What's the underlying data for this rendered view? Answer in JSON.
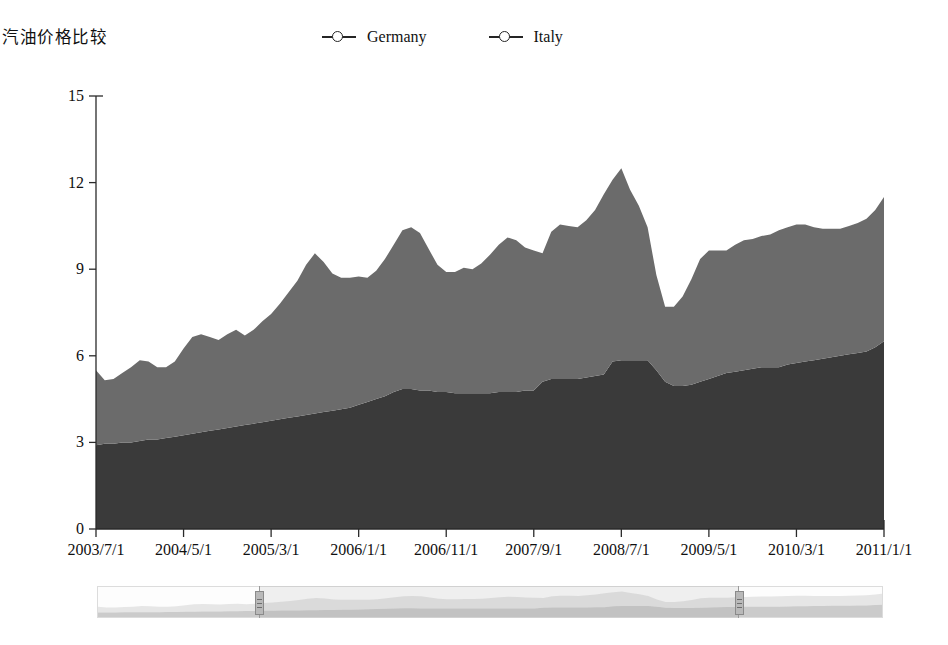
{
  "header": {
    "title": "汽油价格比较"
  },
  "legend": {
    "position": "top-center",
    "items": [
      {
        "label": "Germany",
        "marker": "circle-line-marker-icon",
        "color": "#3a3a3a"
      },
      {
        "label": "Italy",
        "marker": "circle-line-marker-icon",
        "color": "#6b6b6b"
      }
    ]
  },
  "range_selector": {
    "label": "data-zoom-range-selector",
    "start_percent": 20.5,
    "end_percent": 81.5,
    "left_handle": "range-handle-left",
    "right_handle": "range-handle-right"
  },
  "chart_data": {
    "type": "area",
    "stacked": true,
    "title": "汽油价格比较",
    "xlabel": "",
    "ylabel": "",
    "ylim": [
      0,
      15
    ],
    "yticks": [
      0,
      3,
      6,
      9,
      12,
      15
    ],
    "grid": false,
    "legend_position": "top-center",
    "xticks": [
      "2003/7/1",
      "2004/5/1",
      "2005/3/1",
      "2006/1/1",
      "2006/11/1",
      "2007/9/1",
      "2008/7/1",
      "2009/5/1",
      "2010/3/1",
      "2011/1/1"
    ],
    "xtick_interval_months": 10,
    "x": [
      "2003/7/1",
      "2003/8/1",
      "2003/9/1",
      "2003/10/1",
      "2003/11/1",
      "2003/12/1",
      "2004/1/1",
      "2004/2/1",
      "2004/3/1",
      "2004/4/1",
      "2004/5/1",
      "2004/6/1",
      "2004/7/1",
      "2004/8/1",
      "2004/9/1",
      "2004/10/1",
      "2004/11/1",
      "2004/12/1",
      "2005/1/1",
      "2005/2/1",
      "2005/3/1",
      "2005/4/1",
      "2005/5/1",
      "2005/6/1",
      "2005/7/1",
      "2005/8/1",
      "2005/9/1",
      "2005/10/1",
      "2005/11/1",
      "2005/12/1",
      "2006/1/1",
      "2006/2/1",
      "2006/3/1",
      "2006/4/1",
      "2006/5/1",
      "2006/6/1",
      "2006/7/1",
      "2006/8/1",
      "2006/9/1",
      "2006/10/1",
      "2006/11/1",
      "2006/12/1",
      "2007/1/1",
      "2007/2/1",
      "2007/3/1",
      "2007/4/1",
      "2007/5/1",
      "2007/6/1",
      "2007/7/1",
      "2007/8/1",
      "2007/9/1",
      "2007/10/1",
      "2007/11/1",
      "2007/12/1",
      "2008/1/1",
      "2008/2/1",
      "2008/3/1",
      "2008/4/1",
      "2008/5/1",
      "2008/6/1",
      "2008/7/1",
      "2008/8/1",
      "2008/9/1",
      "2008/10/1",
      "2008/11/1",
      "2008/12/1",
      "2009/1/1",
      "2009/2/1",
      "2009/3/1",
      "2009/4/1",
      "2009/5/1",
      "2009/6/1",
      "2009/7/1",
      "2009/8/1",
      "2009/9/1",
      "2009/10/1",
      "2009/11/1",
      "2009/12/1",
      "2010/1/1",
      "2010/2/1",
      "2010/3/1",
      "2010/4/1",
      "2010/5/1",
      "2010/6/1",
      "2010/7/1",
      "2010/8/1",
      "2010/9/1",
      "2010/10/1",
      "2010/11/1",
      "2010/12/1",
      "2011/1/1"
    ],
    "series": [
      {
        "name": "Germany",
        "color": "#3a3a3a",
        "values": [
          2.9,
          2.95,
          2.95,
          3.0,
          3.0,
          3.05,
          3.1,
          3.1,
          3.15,
          3.2,
          3.25,
          3.3,
          3.35,
          3.4,
          3.45,
          3.5,
          3.55,
          3.6,
          3.65,
          3.7,
          3.75,
          3.8,
          3.85,
          3.9,
          3.95,
          4.0,
          4.05,
          4.1,
          4.15,
          4.2,
          4.3,
          4.4,
          4.5,
          4.6,
          4.75,
          4.85,
          4.85,
          4.8,
          4.8,
          4.75,
          4.75,
          4.7,
          4.7,
          4.7,
          4.7,
          4.7,
          4.75,
          4.75,
          4.75,
          4.8,
          4.8,
          5.1,
          5.2,
          5.2,
          5.2,
          5.2,
          5.25,
          5.3,
          5.35,
          5.8,
          5.85,
          5.85,
          5.85,
          5.85,
          5.5,
          5.1,
          4.95,
          4.95,
          5.0,
          5.1,
          5.2,
          5.3,
          5.4,
          5.45,
          5.5,
          5.55,
          5.6,
          5.6,
          5.6,
          5.7,
          5.75,
          5.8,
          5.85,
          5.9,
          5.95,
          6.0,
          6.05,
          6.1,
          6.15,
          6.3,
          6.5
        ]
      },
      {
        "name": "Italy",
        "color": "#6b6b6b",
        "values": [
          2.6,
          2.2,
          2.25,
          2.4,
          2.6,
          2.8,
          2.7,
          2.5,
          2.45,
          2.6,
          3.0,
          3.35,
          3.4,
          3.25,
          3.1,
          3.25,
          3.35,
          3.1,
          3.25,
          3.5,
          3.7,
          4.0,
          4.35,
          4.7,
          5.2,
          5.55,
          5.2,
          4.75,
          4.55,
          4.5,
          4.45,
          4.3,
          4.45,
          4.75,
          5.1,
          5.5,
          5.6,
          5.45,
          4.9,
          4.4,
          4.15,
          4.2,
          4.35,
          4.3,
          4.5,
          4.8,
          5.1,
          5.35,
          5.25,
          4.95,
          4.85,
          4.45,
          5.1,
          5.35,
          5.3,
          5.25,
          5.45,
          5.75,
          6.25,
          6.3,
          6.65,
          5.9,
          5.35,
          4.6,
          3.3,
          2.6,
          2.75,
          3.1,
          3.65,
          4.25,
          4.45,
          4.35,
          4.25,
          4.4,
          4.5,
          4.5,
          4.55,
          4.6,
          4.75,
          4.75,
          4.8,
          4.75,
          4.6,
          4.5,
          4.45,
          4.4,
          4.45,
          4.5,
          4.6,
          4.75,
          5.0
        ]
      }
    ],
    "totals_note": "Italy values are plotted stacked above Germany"
  }
}
